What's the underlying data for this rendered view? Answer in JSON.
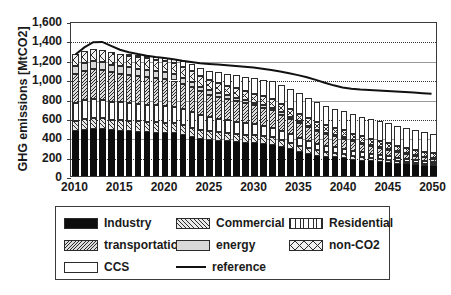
{
  "chart": {
    "type": "bar",
    "ylabel": "GHG emissions [MtCO2]",
    "xlabel": ""
  },
  "axes": {
    "y_ticks": [
      "0",
      "200",
      "400",
      "600",
      "800",
      "1,000",
      "1,200",
      "1,400",
      "1,600"
    ],
    "x_ticks": [
      "2010",
      "2015",
      "2020",
      "2025",
      "2030",
      "2035",
      "2040",
      "2045",
      "2050"
    ]
  },
  "legend": {
    "rows": [
      [
        {
          "label": "Industry",
          "swatch": "industry"
        },
        {
          "label": "Commercial",
          "swatch": "commercial"
        },
        {
          "label": "Residential",
          "swatch": "residential"
        }
      ],
      [
        {
          "label": "transportation",
          "swatch": "transportation"
        },
        {
          "label": "energy",
          "swatch": "energy"
        },
        {
          "label": "non-CO2",
          "swatch": "nonco2"
        }
      ],
      [
        {
          "label": "CCS",
          "swatch": "ccs"
        },
        {
          "label": "reference",
          "swatch": "line"
        }
      ]
    ]
  },
  "chart_data": {
    "type": "bar",
    "stacked": true,
    "title": "",
    "xlabel": "",
    "ylabel": "GHG emissions [MtCO2]",
    "ylim": [
      0,
      1600
    ],
    "ytick_step": 200,
    "grid": true,
    "legend_position": "below",
    "x": [
      2010,
      2011,
      2012,
      2013,
      2014,
      2015,
      2016,
      2017,
      2018,
      2019,
      2020,
      2021,
      2022,
      2023,
      2024,
      2025,
      2026,
      2027,
      2028,
      2029,
      2030,
      2031,
      2032,
      2033,
      2034,
      2035,
      2036,
      2037,
      2038,
      2039,
      2040,
      2041,
      2042,
      2043,
      2044,
      2045,
      2046,
      2047,
      2048,
      2049,
      2050
    ],
    "series": [
      {
        "name": "Industry",
        "pattern": "solid-black",
        "values": [
          460,
          480,
          490,
          488,
          470,
          465,
          460,
          455,
          452,
          448,
          445,
          440,
          420,
          400,
          382,
          370,
          365,
          358,
          352,
          345,
          340,
          335,
          325,
          300,
          275,
          250,
          228,
          210,
          200,
          192,
          185,
          170,
          160,
          152,
          145,
          138,
          128,
          120,
          112,
          105,
          100
        ]
      },
      {
        "name": "Commercial",
        "pattern": "diagonal-hatch-fine",
        "values": [
          110,
          112,
          114,
          113,
          112,
          111,
          110,
          109,
          108,
          107,
          106,
          104,
          102,
          100,
          96,
          93,
          90,
          88,
          85,
          82,
          80,
          77,
          74,
          70,
          66,
          62,
          58,
          54,
          50,
          47,
          44,
          41,
          38,
          35,
          33,
          30,
          28,
          26,
          24,
          22,
          20
        ]
      },
      {
        "name": "Residential",
        "pattern": "vertical-lines",
        "values": [
          185,
          188,
          190,
          188,
          186,
          184,
          182,
          180,
          178,
          176,
          174,
          170,
          166,
          160,
          150,
          142,
          136,
          130,
          124,
          118,
          112,
          106,
          100,
          94,
          88,
          82,
          76,
          70,
          64,
          58,
          54,
          50,
          46,
          42,
          38,
          34,
          31,
          28,
          25,
          23,
          20
        ]
      },
      {
        "name": "transportation",
        "pattern": "diagonal-hatch-dense",
        "values": [
          300,
          305,
          308,
          306,
          302,
          298,
          294,
          290,
          286,
          282,
          278,
          272,
          266,
          258,
          246,
          236,
          228,
          220,
          212,
          204,
          196,
          188,
          180,
          170,
          160,
          150,
          140,
          130,
          120,
          112,
          104,
          96,
          88,
          80,
          73,
          66,
          60,
          54,
          48,
          43,
          38
        ]
      },
      {
        "name": "energy",
        "pattern": "light-gray-solid",
        "values": [
          80,
          82,
          83,
          82,
          80,
          78,
          76,
          74,
          72,
          70,
          68,
          64,
          60,
          56,
          50,
          46,
          42,
          38,
          35,
          32,
          29,
          27,
          25,
          23,
          21,
          19,
          17,
          15,
          14,
          13,
          12,
          11,
          10,
          9,
          8,
          7,
          7,
          6,
          6,
          5,
          5
        ]
      },
      {
        "name": "non-CO2",
        "pattern": "cross-hatch",
        "values": [
          125,
          128,
          130,
          128,
          126,
          124,
          122,
          120,
          118,
          116,
          114,
          112,
          110,
          108,
          105,
          102,
          100,
          98,
          96,
          94,
          92,
          90,
          88,
          86,
          84,
          82,
          80,
          78,
          76,
          74,
          72,
          70,
          68,
          66,
          64,
          62,
          60,
          58,
          56,
          54,
          52
        ]
      },
      {
        "name": "CCS",
        "pattern": "white-open",
        "values": [
          0,
          0,
          0,
          0,
          0,
          0,
          5,
          12,
          20,
          28,
          36,
          48,
          62,
          75,
          88,
          98,
          110,
          122,
          135,
          148,
          160,
          172,
          184,
          196,
          206,
          214,
          210,
          205,
          200,
          198,
          196,
          198,
          200,
          202,
          204,
          206,
          204,
          202,
          200,
          198,
          196
        ]
      }
    ],
    "reference_line": {
      "name": "reference",
      "x": [
        2010,
        2011,
        2012,
        2013,
        2014,
        2015,
        2016,
        2017,
        2018,
        2019,
        2020,
        2021,
        2022,
        2023,
        2024,
        2025,
        2026,
        2027,
        2028,
        2029,
        2030,
        2031,
        2032,
        2033,
        2034,
        2035,
        2036,
        2037,
        2038,
        2039,
        2040,
        2041,
        2042,
        2043,
        2044,
        2045,
        2046,
        2047,
        2048,
        2049,
        2050
      ],
      "values": [
        1270,
        1345,
        1400,
        1402,
        1360,
        1320,
        1295,
        1275,
        1258,
        1245,
        1235,
        1222,
        1205,
        1192,
        1180,
        1172,
        1165,
        1158,
        1150,
        1143,
        1135,
        1122,
        1108,
        1092,
        1075,
        1055,
        1032,
        1005,
        975,
        948,
        925,
        912,
        905,
        900,
        895,
        890,
        884,
        878,
        872,
        866,
        860
      ]
    }
  }
}
